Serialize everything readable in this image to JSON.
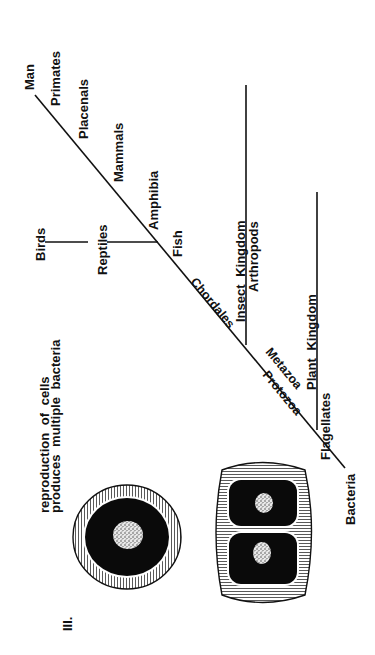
{
  "figure": {
    "section_label": "III.",
    "caption_line1": "reproduction of cells",
    "caption_line2": "produces multiple bacteria",
    "orientation": "rotated 90 degrees counter-clockwise"
  },
  "tree": {
    "trunk_labels": {
      "top": "Man",
      "bottom": "Bacteria"
    },
    "side_labels": [
      {
        "id": "primates",
        "text": "Primates"
      },
      {
        "id": "placenals",
        "text": "Placenals"
      },
      {
        "id": "mammals",
        "text": "Mammals"
      },
      {
        "id": "amphibia",
        "text": "Amphibia"
      },
      {
        "id": "fish",
        "text": "Fish"
      }
    ],
    "along_trunk_labels": [
      {
        "id": "chordales",
        "text": "Chordales"
      },
      {
        "id": "metazoa",
        "text": "Metazoa"
      },
      {
        "id": "protozoa",
        "text": "Protozoa"
      }
    ],
    "branches": {
      "reptiles": {
        "text": "Reptiles"
      },
      "birds": {
        "text": "Birds"
      },
      "insect_kingdom": {
        "text": "Insect Kingdom"
      },
      "arthropods": {
        "text": "Arthropods"
      },
      "plant_kingdom": {
        "text": "Plant Kingdom"
      },
      "flagellates": {
        "text": "Flagellates"
      }
    }
  },
  "cells": [
    {
      "id": "single-cell",
      "description": "single bacterium with nucleus"
    },
    {
      "id": "dividing-cell",
      "description": "bacterium dividing into two cells"
    }
  ],
  "colors": {
    "ink": "#111111",
    "paper": "#ffffff"
  }
}
